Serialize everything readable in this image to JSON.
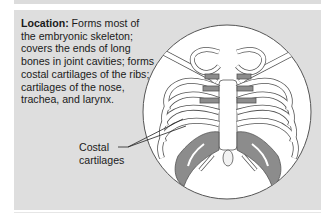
{
  "description": {
    "heading": "Location:",
    "text": " Forms most of the embryonic skeleton; covers the ends of long bones in joint cavities; forms costal cartilages of the ribs; cartilages of the nose, trachea, and larynx."
  },
  "callout": {
    "line1": "Costal",
    "line2": "cartilages"
  },
  "figure": {
    "highlight_color": "#8c8c8c",
    "bone_color": "#ffffff",
    "panel_color": "#dedede"
  }
}
